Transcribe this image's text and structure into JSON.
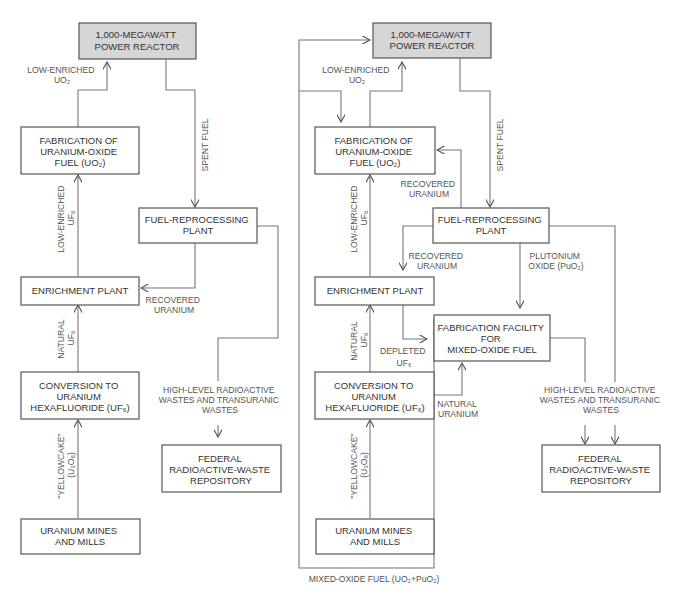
{
  "left_diagram": {
    "nodes": {
      "reactor": [
        "1,000-MEGAWATT",
        "POWER REACTOR"
      ],
      "fabrication_uo2": [
        "FABRICATION OF",
        "URANIUM-OXIDE",
        "FUEL (UO₂)"
      ],
      "reprocessing": [
        "FUEL-REPROCESSING",
        "PLANT"
      ],
      "enrichment": [
        "ENRICHMENT PLANT"
      ],
      "conversion": [
        "CONVERSION TO",
        "URANIUM",
        "HEXAFLUORIDE (UF₆)"
      ],
      "repository": [
        "FEDERAL",
        "RADIOACTIVE-WASTE",
        "REPOSITORY"
      ],
      "mines": [
        "URANIUM MINES",
        "AND MILLS"
      ]
    },
    "edge_labels": {
      "low_enriched_uo2": [
        "LOW-ENRICHED",
        "UO₂"
      ],
      "spent_fuel": [
        "SPENT FUEL"
      ],
      "low_enriched_uf6": [
        "LOW-ENRICHED",
        "UF₆"
      ],
      "recovered_uranium": [
        "RECOVERED",
        "URANIUM"
      ],
      "natural_uf6": [
        "NATURAL",
        "UF₆"
      ],
      "wastes": [
        "HIGH-LEVEL RADIOACTIVE",
        "WASTES AND TRANSURANIC",
        "WASTES"
      ],
      "yellowcake": [
        "\"YELLOWCAKE\"",
        "(U₃O₈)"
      ]
    }
  },
  "right_diagram": {
    "nodes": {
      "reactor": [
        "1,000-MEGAWATT",
        "POWER REACTOR"
      ],
      "fabrication_uo2": [
        "FABRICATION OF",
        "URANIUM-OXIDE",
        "FUEL (UO₂)"
      ],
      "reprocessing": [
        "FUEL-REPROCESSING",
        "PLANT"
      ],
      "enrichment": [
        "ENRICHMENT PLANT"
      ],
      "mox_fabrication": [
        "FABRICATION FACILITY",
        "FOR",
        "MIXED-OXIDE FUEL"
      ],
      "conversion": [
        "CONVERSION TO",
        "URANIUM",
        "HEXAFLUORIDE (UF₆)"
      ],
      "repository": [
        "FEDERAL",
        "RADIOACTIVE-WASTE",
        "REPOSITORY"
      ],
      "mines": [
        "URANIUM MINES",
        "AND MILLS"
      ]
    },
    "edge_labels": {
      "low_enriched_uo2": [
        "LOW-ENRICHED",
        "UO₂"
      ],
      "spent_fuel": [
        "SPENT FUEL"
      ],
      "recovered_uranium_top": [
        "RECOVERED",
        "URANIUM"
      ],
      "low_enriched_uf6": [
        "LOW-ENRICHED",
        "UF₆"
      ],
      "recovered_uranium_mid": [
        "RECOVERED",
        "URANIUM"
      ],
      "plutonium_oxide": [
        "PLUTONIUM",
        "OXIDE (PuO₂)"
      ],
      "natural_uf6": [
        "NATURAL",
        "UF₆"
      ],
      "depleted_uf6": [
        "DEPLETED",
        "UF₆"
      ],
      "natural_uranium": [
        "NATURAL",
        "URANIUM"
      ],
      "wastes": [
        "HIGH-LEVEL RADIOACTIVE",
        "WASTES AND TRANSURANIC",
        "WASTES"
      ],
      "yellowcake": [
        "\"YELLOWCAKE\"",
        "(U₃O₈)"
      ],
      "mox_fuel": [
        "MIXED-OXIDE FUEL (UO₂+PuO₂)"
      ]
    }
  }
}
